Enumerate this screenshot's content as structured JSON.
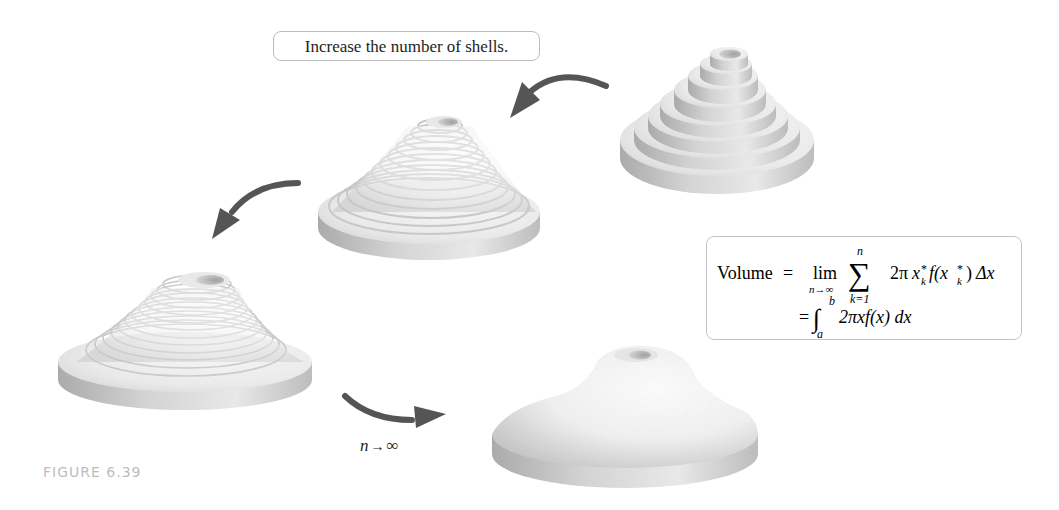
{
  "callout": {
    "text": "Increase the number of shells."
  },
  "formula": {
    "lhs": "Volume",
    "equals": "=",
    "lim": "lim",
    "lim_sub": "n→∞",
    "sum_symbol": "∑",
    "sum_upper": "n",
    "sum_lower": "k=1",
    "summand_coef": "2π",
    "summand_x": "x",
    "summand_x_sub": "k",
    "summand_star": "*",
    "summand_f": "f(x",
    "summand_close": ")",
    "summand_dx": "Δx",
    "line2_equals": "=",
    "integral_symbol": "∫",
    "integral_upper": "b",
    "integral_lower": "a",
    "integrand": "2πxf(x) dx"
  },
  "limit_label": {
    "n": "n",
    "arrow": "→",
    "infinity": "∞"
  },
  "figure_label": "FIGURE 6.39",
  "solids": [
    {
      "id": "few-shells",
      "shells": 8
    },
    {
      "id": "more-shells",
      "shells": 14
    },
    {
      "id": "many-shells",
      "shells": 20
    },
    {
      "id": "smooth-solid",
      "shells": 0
    }
  ],
  "colors": {
    "arrow": "#555555",
    "solid_light": "#f2f2f2",
    "solid_shadow": "#a8a8a8",
    "border": "#c4c4c4",
    "caption": "#bdbdbd"
  }
}
